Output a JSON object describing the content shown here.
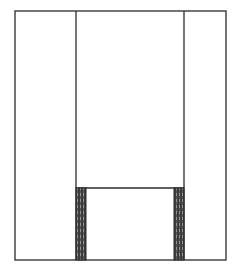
{
  "diagram": {
    "type": "line-drawing",
    "stroke_color": "#2a2a2a",
    "shade_color": "#3a3a3a",
    "background": "#ffffff",
    "outer_frame": {
      "x": 15,
      "y": 11,
      "width": 211,
      "height": 249
    },
    "left_divider_x": 76,
    "right_divider_x": 184,
    "inner_horizontal_y": 188,
    "left_shaded_bar": {
      "x": 76,
      "y": 188,
      "width": 10,
      "height": 72
    },
    "right_shaded_bar": {
      "x": 174,
      "y": 188,
      "width": 10,
      "height": 72
    }
  }
}
